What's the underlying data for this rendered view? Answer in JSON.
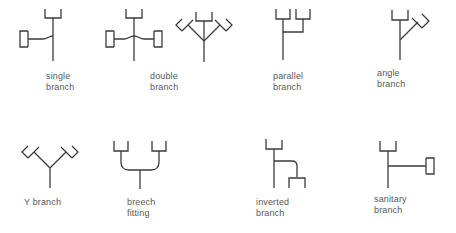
{
  "figure": {
    "kind": "piping-branch-fitting-symbols",
    "background_color": "#ffffff",
    "line_color": "#3b3b3b",
    "text_color": "#585858",
    "stroke_width": 1.3
  },
  "symbols": [
    {
      "id": "single-branch",
      "row": 1,
      "label": "single\nbranch",
      "label_line1": "single",
      "label_line2": "branch",
      "description": "vertical run with bell socket at top and one horizontal side branch to the left ending in a C-shaped hub"
    },
    {
      "id": "double-branch",
      "row": 1,
      "label": "double\nbranch",
      "label_line1": "double",
      "label_line2": "branch",
      "description": "vertical run with bell socket at top and two opposed horizontal side branches, each ending in a C-shaped hub; shown also in an angled 45-degree variant"
    },
    {
      "id": "double-branch-angled",
      "row": 1,
      "label": "",
      "label_line1": "",
      "label_line2": "",
      "description": "angled variant of the double branch with two 45-degree arms ending in angled hubs"
    },
    {
      "id": "parallel-branch",
      "row": 1,
      "label": "parallel\nbranch",
      "label_line1": "parallel",
      "label_line2": "branch",
      "description": "two parallel vertical risers with bell sockets joining into a single vertical run"
    },
    {
      "id": "angle-branch",
      "row": 1,
      "label": "angle\nbranch",
      "label_line1": "angle",
      "label_line2": "branch",
      "description": "vertical run with bell socket at top and one 45-degree branch up to the right ending in an angled hub"
    },
    {
      "id": "y-branch",
      "row": 2,
      "label": "Y branch",
      "label_line1": "Y branch",
      "label_line2": "",
      "description": "vertical run splitting into two symmetric 45-degree arms, each ending in an angled hub"
    },
    {
      "id": "breech-fitting",
      "row": 2,
      "label": "breech\nfitting",
      "label_line1": "breech",
      "label_line2": "fitting",
      "description": "two vertical risers with bell sockets curving inward and merging into a single vertical run"
    },
    {
      "id": "inverted-branch",
      "row": 2,
      "label": "inverted\nbranch",
      "label_line1": "inverted",
      "label_line2": "branch",
      "description": "vertical run with bell socket at top and a branch leaving to the right then turning down to a bell socket"
    },
    {
      "id": "sanitary-branch",
      "row": 2,
      "label": "sanitary\nbranch",
      "label_line1": "sanitary",
      "label_line2": "branch",
      "description": "vertical run with bell socket at top and a long horizontal branch to the right ending in a C-shaped hub"
    }
  ]
}
